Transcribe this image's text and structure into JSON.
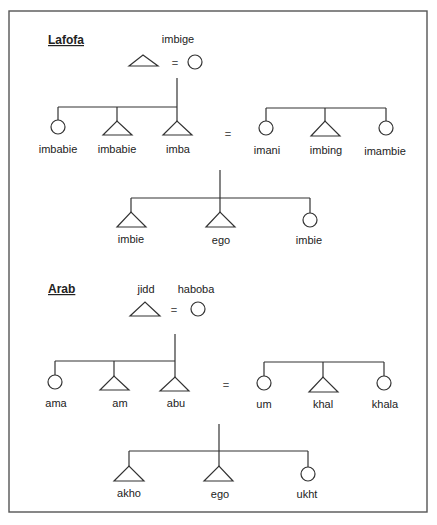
{
  "diagram": {
    "type": "kinship-chart",
    "legend": {
      "male": "triangle",
      "female": "circle",
      "marriage": "="
    },
    "sections": [
      {
        "title": "Lafofa",
        "grandparents": {
          "male_label": "",
          "female_label": "imbige",
          "label": "imbige"
        },
        "father_siblings": [
          {
            "label": "imbabie",
            "sex": "female"
          },
          {
            "label": "imbabie",
            "sex": "male"
          },
          {
            "label": "imba",
            "sex": "male"
          }
        ],
        "mother_siblings": [
          {
            "label": "imani",
            "sex": "female"
          },
          {
            "label": "imbing",
            "sex": "male"
          },
          {
            "label": "imambie",
            "sex": "female"
          }
        ],
        "children": [
          {
            "label": "imbie",
            "sex": "male"
          },
          {
            "label": "ego",
            "sex": "male"
          },
          {
            "label": "imbie",
            "sex": "female"
          }
        ]
      },
      {
        "title": "Arab",
        "grandparents": {
          "male_label": "jidd",
          "female_label": "haboba"
        },
        "father_siblings": [
          {
            "label": "ama",
            "sex": "female"
          },
          {
            "label": "am",
            "sex": "male"
          },
          {
            "label": "abu",
            "sex": "male"
          }
        ],
        "mother_siblings": [
          {
            "label": "um",
            "sex": "female"
          },
          {
            "label": "khal",
            "sex": "male"
          },
          {
            "label": "khala",
            "sex": "female"
          }
        ],
        "children": [
          {
            "label": "akho",
            "sex": "male"
          },
          {
            "label": "ego",
            "sex": "male"
          },
          {
            "label": "ukht",
            "sex": "female"
          }
        ]
      }
    ],
    "marriage_symbol": "="
  }
}
